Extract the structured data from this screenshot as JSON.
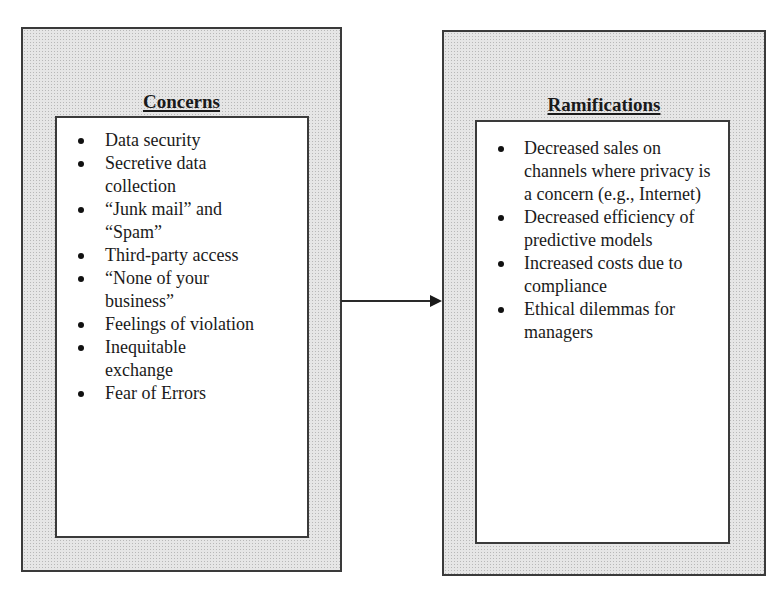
{
  "diagram": {
    "type": "flow",
    "colors": {
      "border": "#3a3a3a",
      "stipple_bg": "#e6e6e6",
      "inner_bg": "#ffffff",
      "text": "#1a1a1a"
    },
    "left_box": {
      "title": "Concerns",
      "items": [
        "Data security",
        "Secretive data collection",
        "“Junk mail” and “Spam”",
        "Third-party access",
        "“None of your business”",
        "Feelings of violation",
        "Inequitable exchange",
        "Fear of Errors"
      ]
    },
    "right_box": {
      "title": "Ramifications",
      "items": [
        "Decreased sales on channels where privacy is a concern (e.g., Internet)",
        "Decreased efficiency of predictive models",
        "Increased costs due to compliance",
        "Ethical dilemmas for managers"
      ]
    },
    "connector": {
      "from": "Concerns",
      "to": "Ramifications",
      "icon": "arrow-right-icon"
    }
  }
}
